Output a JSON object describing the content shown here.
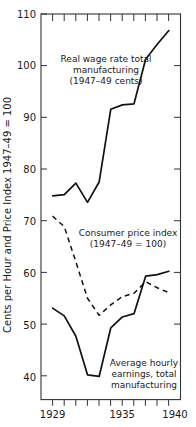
{
  "chart_data": {
    "type": "line",
    "title": "",
    "xlabel": "",
    "ylabel": "Cents per Hour and Price Index 1947–49 = 100",
    "xlim": [
      1928,
      1940
    ],
    "ylim": [
      40,
      110
    ],
    "grid": false,
    "legend_position": "inline-annotations",
    "x_ticks_major": [
      1929,
      1935,
      1940
    ],
    "x_tick_labels": [
      "1929",
      "1935",
      "1940"
    ],
    "x_ticks_minor": [
      1929,
      1930,
      1931,
      1932,
      1933,
      1934,
      1935,
      1936,
      1937,
      1938,
      1939,
      1940
    ],
    "y_ticks": [
      40,
      50,
      60,
      70,
      80,
      90,
      100,
      110
    ],
    "y_tick_labels": [
      "40",
      "50",
      "60",
      "70",
      "80",
      "90",
      "100",
      "110"
    ],
    "series": [
      {
        "name": "Real wage rate total manufacturing (1947–49 cents)",
        "style": "solid",
        "x": [
          1929,
          1930,
          1931,
          1932,
          1933,
          1934,
          1935,
          1936,
          1937,
          1938,
          1939
        ],
        "values": [
          77.0,
          77.2,
          79.3,
          75.8,
          79.5,
          92.7,
          93.5,
          93.7,
          101.8,
          104.5,
          107.0
        ]
      },
      {
        "name": "Consumer price index (1947–49 = 100)",
        "style": "dashed",
        "x": [
          1929,
          1930,
          1931,
          1932,
          1933,
          1934,
          1935,
          1936,
          1937,
          1938,
          1939
        ],
        "values": [
          73.3,
          71.4,
          65.0,
          58.4,
          55.3,
          57.2,
          58.7,
          59.3,
          61.4,
          60.3,
          59.4
        ]
      },
      {
        "name": "Average hourly earnings, total manufacturing",
        "style": "solid",
        "x": [
          1929,
          1930,
          1931,
          1932,
          1933,
          1934,
          1935,
          1936,
          1937,
          1938,
          1939
        ],
        "values": [
          56.6,
          55.2,
          51.5,
          44.5,
          44.2,
          53.0,
          55.0,
          55.6,
          62.4,
          62.7,
          63.3
        ]
      }
    ],
    "annotations": [
      {
        "id": "real-wage-annotation",
        "lines": [
          "Real wage rate total",
          "manufacturing",
          "(1947–49 cents)"
        ]
      },
      {
        "id": "cpi-annotation",
        "lines": [
          "Consumer price index",
          "(1947–49 = 100)"
        ]
      },
      {
        "id": "earnings-annotation",
        "lines": [
          "Average hourly",
          "earnings, total",
          "manufacturing"
        ]
      }
    ],
    "colors": {
      "line": "#111111",
      "axis": "#333333",
      "background": "#ffffff",
      "text": "#1a1a1a"
    }
  }
}
